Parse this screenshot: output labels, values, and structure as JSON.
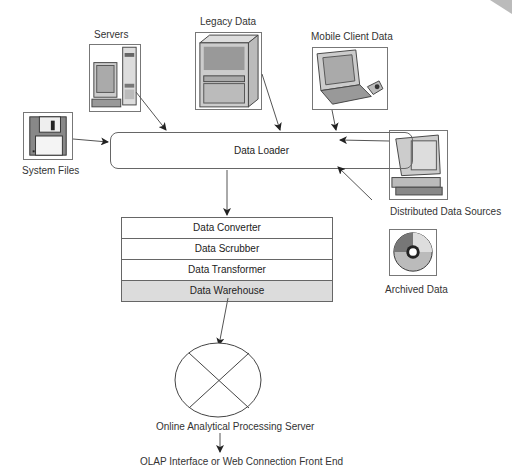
{
  "sources": {
    "servers": {
      "label": "Servers",
      "icon": "server-computer-icon"
    },
    "legacy": {
      "label": "Legacy Data",
      "icon": "mainframe-icon"
    },
    "mobile": {
      "label": "Mobile Client Data",
      "icon": "laptop-icon"
    },
    "system_files": {
      "label": "System Files",
      "icon": "floppy-disk-icon"
    },
    "distributed": {
      "label": "Distributed Data Sources",
      "icon": "desktop-computer-icon"
    },
    "archived": {
      "label": "Archived Data",
      "icon": "cd-disc-icon"
    }
  },
  "loader": {
    "label": "Data Loader"
  },
  "stack": {
    "rows": [
      "Data Converter",
      "Data Scrubber",
      "Data Transformer",
      "Data Warehouse"
    ]
  },
  "olap": {
    "label": "Online Analytical Processing Server",
    "frontend": "OLAP Interface or Web Connection Front End"
  },
  "colors": {
    "line": "#555555",
    "warehouse_fill": "#dcdcdc"
  }
}
